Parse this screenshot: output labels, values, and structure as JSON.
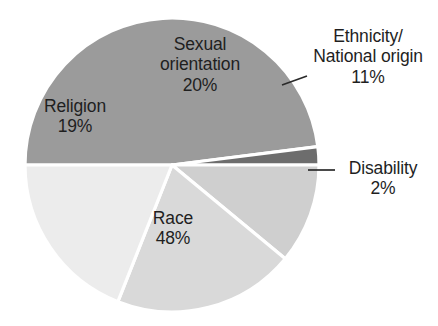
{
  "chart_data": {
    "type": "pie",
    "title": "",
    "subtitle": "",
    "xlabel": "",
    "ylabel": "",
    "grid": false,
    "legend_position": "none",
    "labels_position": "callout-and-inside",
    "units": "percent",
    "total": 100,
    "categories": [
      "Religion",
      "Sexual orientation",
      "Ethnicity/\nNational origin",
      "Disability",
      "Race"
    ],
    "values": [
      19,
      20,
      11,
      2,
      48
    ],
    "slices": [
      {
        "name": "Religion",
        "value": 19,
        "value_label": "19%",
        "color": "#ececec",
        "label_placement": "inside",
        "has_leader_line": false
      },
      {
        "name": "Sexual orientation",
        "value": 20,
        "value_label": "20%",
        "color": "#d9d9d9",
        "label_placement": "inside",
        "has_leader_line": false
      },
      {
        "name": "Ethnicity/\nNational origin",
        "value": 11,
        "value_label": "11%",
        "color": "#cfcfcf",
        "label_placement": "outside",
        "has_leader_line": true
      },
      {
        "name": "Disability",
        "value": 2,
        "value_label": "2%",
        "color": "#6d6d6d",
        "label_placement": "outside",
        "has_leader_line": true
      },
      {
        "name": "Race",
        "value": 48,
        "value_label": "48%",
        "color": "#9b9b9b",
        "label_placement": "inside",
        "has_leader_line": false
      }
    ]
  },
  "labels": {
    "religion": {
      "name": "Religion",
      "pct": "19%"
    },
    "sexual_orientation": {
      "name": "Sexual\norientation",
      "pct": "20%"
    },
    "ethnicity": {
      "name": "Ethnicity/\nNational origin",
      "pct": "11%"
    },
    "disability": {
      "name": "Disability",
      "pct": "2%"
    },
    "race": {
      "name": "Race",
      "pct": "48%"
    }
  },
  "colors": {
    "background": "#ffffff",
    "text": "#1f1f1f",
    "slice_border": "#ffffff",
    "leader_line": "#2a2a2a",
    "religion": "#ececec",
    "sexual_orientation": "#d9d9d9",
    "ethnicity": "#cfcfcf",
    "disability": "#6d6d6d",
    "race": "#9b9b9b"
  },
  "geometry": {
    "center_x": 172,
    "center_y": 165,
    "radius": 147
  }
}
